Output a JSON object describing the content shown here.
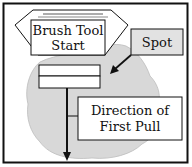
{
  "diagram": {
    "start_label_line1": "Brush Tool",
    "start_label_line2": "Start",
    "spot_label": "Spot",
    "direction_label_line1": "Direction of",
    "direction_label_line2": "First Pull"
  },
  "colors": {
    "stroke": "#111111",
    "spot_fill": "#d8d8d8",
    "spot_box_fill": "#e2e2e2",
    "background": "#ffffff"
  }
}
